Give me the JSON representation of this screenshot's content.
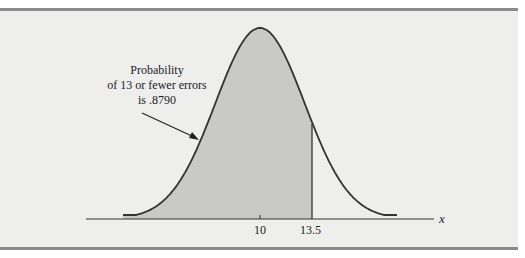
{
  "chart_data": {
    "type": "area",
    "title": "",
    "distribution": "normal",
    "mean": 10,
    "shaded_upper_bound": 13.5,
    "shaded_probability": 0.879,
    "xlabel": "x",
    "ylabel": "",
    "x_ticks": [
      {
        "value": 10,
        "label": "10"
      },
      {
        "value": 13.5,
        "label": "13.5"
      }
    ],
    "annotation": {
      "lines": [
        "Probability",
        "of 13 or fewer errors",
        "is .8790"
      ]
    },
    "grid": false,
    "legend": null
  },
  "colors": {
    "panel_bg": "#eeeeed",
    "shade": "#c9c9c8",
    "curve": "#333333",
    "border": "#8a8a8a"
  }
}
